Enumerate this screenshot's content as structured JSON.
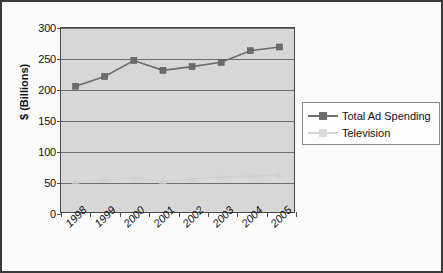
{
  "chart_data": {
    "type": "line",
    "title": "",
    "xlabel": "",
    "ylabel": "$ (Billions)",
    "categories": [
      "1998",
      "1999",
      "2000",
      "2001",
      "2002",
      "2003",
      "2004",
      "2005"
    ],
    "ylim": [
      0,
      300
    ],
    "yticks": [
      0,
      50,
      100,
      150,
      200,
      250,
      300
    ],
    "ytick_labels": [
      "0",
      "50",
      "100",
      "150",
      "200",
      "250",
      "300"
    ],
    "grid": true,
    "legend_position": "right",
    "series": [
      {
        "name": "Total Ad Spending",
        "color": "#6b6b6b",
        "marker": "square",
        "values": [
          205,
          221,
          247,
          231,
          237,
          244,
          263,
          269
        ]
      },
      {
        "name": "Television",
        "color": "#cfcfcf",
        "marker": "triangle",
        "values": [
          50,
          52,
          56,
          50,
          54,
          57,
          59,
          60
        ]
      }
    ]
  },
  "legend": {
    "items": [
      {
        "label": "Total Ad Spending"
      },
      {
        "label": "Television"
      }
    ]
  },
  "colors": {
    "plot_background": "#d7d7d7",
    "gridline": "#6e6e6e",
    "axis": "#4a4a4a",
    "frame": "#3a3a3a",
    "series_primary": "#6b6b6b",
    "series_secondary": "#cfcfcf"
  }
}
